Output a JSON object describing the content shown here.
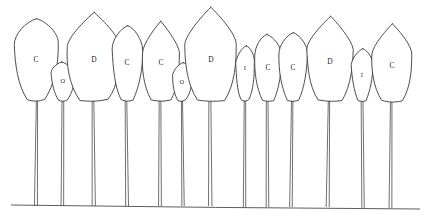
{
  "figure": {
    "stroke_color": "#3a3a3a",
    "background_color": "#ffffff",
    "label_color": "#262626"
  },
  "ground": {
    "name": "ground-line",
    "x1": 11,
    "y1": 205,
    "x2": 420,
    "y2": 209
  },
  "legend_codes": [
    "C",
    "D",
    "O",
    "I"
  ],
  "trees": [
    {
      "index": 1,
      "label": "C",
      "crown_cx": 36,
      "crown_cy": 58,
      "crown_rx": 22,
      "crown_ry": 42,
      "crown_top": 18,
      "crown_bottom": 100,
      "shape": "oval",
      "trunk_x": 37,
      "trunk_top": 96,
      "trunk_bottom": 206,
      "trunk_width": 3.0,
      "label_x": 36,
      "label_y": 60,
      "size": "large"
    },
    {
      "index": 2,
      "label": "O",
      "crown_cx": 63,
      "crown_cy": 81,
      "crown_rx": 11,
      "crown_ry": 19,
      "crown_top": 62,
      "crown_bottom": 100,
      "shape": "oval",
      "trunk_x": 63,
      "trunk_top": 98,
      "trunk_bottom": 206,
      "trunk_width": 2.6,
      "label_x": 63,
      "label_y": 82,
      "size": "small"
    },
    {
      "index": 3,
      "label": "D",
      "crown_cx": 94,
      "crown_cy": 56,
      "crown_rx": 27,
      "crown_ry": 44,
      "crown_top": 13,
      "crown_bottom": 100,
      "shape": "ogival",
      "trunk_x": 93,
      "trunk_top": 96,
      "trunk_bottom": 206,
      "trunk_width": 3.2,
      "label_x": 94,
      "label_y": 60,
      "size": "large"
    },
    {
      "index": 4,
      "label": "C",
      "crown_cx": 127,
      "crown_cy": 62,
      "crown_rx": 15,
      "crown_ry": 38,
      "crown_top": 25,
      "crown_bottom": 100,
      "shape": "oval",
      "trunk_x": 126,
      "trunk_top": 97,
      "trunk_bottom": 206,
      "trunk_width": 2.8,
      "label_x": 127,
      "label_y": 63,
      "size": "medium"
    },
    {
      "index": 5,
      "label": "C",
      "crown_cx": 161,
      "crown_cy": 60,
      "crown_rx": 19,
      "crown_ry": 40,
      "crown_top": 21,
      "crown_bottom": 100,
      "shape": "ogival",
      "trunk_x": 160,
      "trunk_top": 97,
      "trunk_bottom": 206,
      "trunk_width": 2.8,
      "label_x": 161,
      "label_y": 63,
      "size": "medium"
    },
    {
      "index": 6,
      "label": "O",
      "crown_cx": 182,
      "crown_cy": 81,
      "crown_rx": 10,
      "crown_ry": 18,
      "crown_top": 63,
      "crown_bottom": 100,
      "shape": "oval",
      "trunk_x": 182,
      "trunk_top": 98,
      "trunk_bottom": 206,
      "trunk_width": 2.4,
      "label_x": 182,
      "label_y": 83,
      "size": "small"
    },
    {
      "index": 7,
      "label": "D",
      "crown_cx": 211,
      "crown_cy": 54,
      "crown_rx": 26,
      "crown_ry": 46,
      "crown_top": 8,
      "crown_bottom": 100,
      "shape": "ogival",
      "trunk_x": 210,
      "trunk_top": 96,
      "trunk_bottom": 206,
      "trunk_width": 3.4,
      "label_x": 211,
      "label_y": 60,
      "size": "large"
    },
    {
      "index": 8,
      "label": "I",
      "crown_cx": 245,
      "crown_cy": 73,
      "crown_rx": 10,
      "crown_ry": 27,
      "crown_top": 46,
      "crown_bottom": 100,
      "shape": "oval",
      "trunk_x": 245,
      "trunk_top": 98,
      "trunk_bottom": 207,
      "trunk_width": 2.4,
      "label_x": 245,
      "label_y": 69,
      "size": "small"
    },
    {
      "index": 9,
      "label": "C",
      "crown_cx": 268,
      "crown_cy": 67,
      "crown_rx": 14,
      "crown_ry": 33,
      "crown_top": 34,
      "crown_bottom": 100,
      "shape": "oval",
      "trunk_x": 267,
      "trunk_top": 98,
      "trunk_bottom": 207,
      "trunk_width": 2.6,
      "label_x": 268,
      "label_y": 68,
      "size": "medium"
    },
    {
      "index": 10,
      "label": "C",
      "crown_cx": 293,
      "crown_cy": 66,
      "crown_rx": 14,
      "crown_ry": 34,
      "crown_top": 32,
      "crown_bottom": 100,
      "shape": "oval",
      "trunk_x": 292,
      "trunk_top": 98,
      "trunk_bottom": 207,
      "trunk_width": 2.6,
      "label_x": 293,
      "label_y": 68,
      "size": "medium"
    },
    {
      "index": 11,
      "label": "D",
      "crown_cx": 330,
      "crown_cy": 57,
      "crown_rx": 23,
      "crown_ry": 43,
      "crown_top": 16,
      "crown_bottom": 100,
      "shape": "ogival",
      "trunk_x": 329,
      "trunk_top": 97,
      "trunk_bottom": 207,
      "trunk_width": 3.0,
      "label_x": 330,
      "label_y": 62,
      "size": "large"
    },
    {
      "index": 12,
      "label": "I",
      "crown_cx": 362,
      "crown_cy": 74,
      "crown_rx": 10,
      "crown_ry": 26,
      "crown_top": 48,
      "crown_bottom": 100,
      "shape": "oval",
      "trunk_x": 362,
      "trunk_top": 98,
      "trunk_bottom": 208,
      "trunk_width": 2.4,
      "label_x": 362,
      "label_y": 76,
      "size": "small"
    },
    {
      "index": 13,
      "label": "C",
      "crown_cx": 392,
      "crown_cy": 62,
      "crown_rx": 20,
      "crown_ry": 39,
      "crown_top": 24,
      "crown_bottom": 101,
      "shape": "ogival",
      "trunk_x": 391,
      "trunk_top": 98,
      "trunk_bottom": 208,
      "trunk_width": 2.8,
      "label_x": 392,
      "label_y": 66,
      "size": "large"
    }
  ]
}
